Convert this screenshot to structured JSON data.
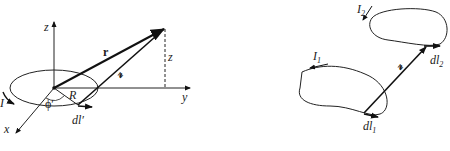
{
  "left_diagram": {
    "axis_labels": {
      "z": "z",
      "y": "y",
      "x": "x"
    },
    "vector_r": "r",
    "vector_script_r": "𝓇",
    "height_label": "z",
    "radius_label": "R",
    "angle_label": "ϕ′",
    "current_label": "I",
    "element_label": "dl′"
  },
  "right_diagram": {
    "loop1_current": "I",
    "loop1_sub": "1",
    "loop2_current": "I",
    "loop2_sub": "2",
    "separation": "𝓇",
    "element1": "dl",
    "element1_sub": "1",
    "element2": "dl",
    "element2_sub": "2"
  }
}
